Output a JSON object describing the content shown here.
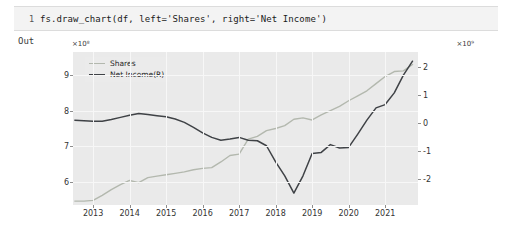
{
  "notebook": {
    "cell_number": "1",
    "code": "fs.draw_chart(df, left='Shares', right='Net Income')",
    "out_label": "Out"
  },
  "chart_data": {
    "type": "line",
    "title": "",
    "xlabel": "",
    "ylabel": "",
    "grid": true,
    "legend_position": "upper-left",
    "left_axis": {
      "label": "Shares",
      "offset_text": "×10⁸",
      "ticks": [
        "9",
        "8",
        "7",
        "6"
      ],
      "tick_values": [
        9,
        8,
        7,
        6
      ],
      "ylim": [
        5.35,
        9.65
      ]
    },
    "right_axis": {
      "label": "Net Income(R)",
      "offset_text": "×10⁹",
      "ticks": [
        "2",
        "1",
        "0",
        "-1",
        "-2"
      ],
      "tick_values": [
        2,
        1,
        0,
        -1,
        -2
      ],
      "ylim": [
        -2.95,
        2.55
      ]
    },
    "x": {
      "ticks": [
        "2013",
        "2014",
        "2015",
        "2016",
        "2017",
        "2018",
        "2019",
        "2020",
        "2021"
      ],
      "tick_values": [
        2013,
        2014,
        2015,
        2016,
        2017,
        2018,
        2019,
        2020,
        2021
      ],
      "xlim": [
        2012.45,
        2021.9
      ]
    },
    "colors": {
      "shares": "#b3b8ae",
      "net_income": "#3f4246",
      "plot_background": "#eaeaea",
      "grid": "#f7f7f7"
    },
    "series": [
      {
        "name": "Shares",
        "axis": "left",
        "color": "#b3b8ae",
        "unit": "1e8",
        "points": [
          [
            2012.5,
            5.46
          ],
          [
            2012.75,
            5.46
          ],
          [
            2013.0,
            5.48
          ],
          [
            2013.25,
            5.62
          ],
          [
            2013.5,
            5.78
          ],
          [
            2013.75,
            5.92
          ],
          [
            2014.0,
            6.04
          ],
          [
            2014.25,
            5.98
          ],
          [
            2014.5,
            6.12
          ],
          [
            2014.75,
            6.16
          ],
          [
            2015.0,
            6.2
          ],
          [
            2015.25,
            6.24
          ],
          [
            2015.5,
            6.28
          ],
          [
            2015.75,
            6.34
          ],
          [
            2016.0,
            6.38
          ],
          [
            2016.25,
            6.4
          ],
          [
            2016.5,
            6.56
          ],
          [
            2016.75,
            6.74
          ],
          [
            2017.0,
            6.78
          ],
          [
            2017.25,
            7.2
          ],
          [
            2017.5,
            7.28
          ],
          [
            2017.75,
            7.44
          ],
          [
            2018.0,
            7.5
          ],
          [
            2018.25,
            7.58
          ],
          [
            2018.5,
            7.76
          ],
          [
            2018.75,
            7.8
          ],
          [
            2019.0,
            7.74
          ],
          [
            2019.25,
            7.88
          ],
          [
            2019.5,
            8.0
          ],
          [
            2019.75,
            8.12
          ],
          [
            2020.0,
            8.28
          ],
          [
            2020.25,
            8.42
          ],
          [
            2020.5,
            8.56
          ],
          [
            2020.75,
            8.76
          ],
          [
            2021.0,
            8.96
          ],
          [
            2021.25,
            9.1
          ],
          [
            2021.5,
            9.12
          ],
          [
            2021.75,
            9.3
          ]
        ]
      },
      {
        "name": "Net Income(R)",
        "axis": "right",
        "color": "#3f4246",
        "unit": "1e9",
        "points": [
          [
            2012.5,
            0.1
          ],
          [
            2012.75,
            0.08
          ],
          [
            2013.0,
            0.06
          ],
          [
            2013.25,
            0.06
          ],
          [
            2013.5,
            0.12
          ],
          [
            2013.75,
            0.2
          ],
          [
            2014.0,
            0.28
          ],
          [
            2014.25,
            0.34
          ],
          [
            2014.5,
            0.3
          ],
          [
            2014.75,
            0.26
          ],
          [
            2015.0,
            0.22
          ],
          [
            2015.25,
            0.14
          ],
          [
            2015.5,
            0.02
          ],
          [
            2015.75,
            -0.16
          ],
          [
            2016.0,
            -0.36
          ],
          [
            2016.25,
            -0.52
          ],
          [
            2016.5,
            -0.62
          ],
          [
            2016.75,
            -0.58
          ],
          [
            2017.0,
            -0.52
          ],
          [
            2017.25,
            -0.62
          ],
          [
            2017.5,
            -0.64
          ],
          [
            2017.75,
            -0.82
          ],
          [
            2018.0,
            -1.4
          ],
          [
            2018.25,
            -1.9
          ],
          [
            2018.5,
            -2.52
          ],
          [
            2018.75,
            -1.9
          ],
          [
            2019.0,
            -1.1
          ],
          [
            2019.25,
            -1.06
          ],
          [
            2019.5,
            -0.78
          ],
          [
            2019.75,
            -0.9
          ],
          [
            2020.0,
            -0.88
          ],
          [
            2020.25,
            -0.4
          ],
          [
            2020.5,
            0.1
          ],
          [
            2020.75,
            0.54
          ],
          [
            2021.0,
            0.66
          ],
          [
            2021.25,
            1.08
          ],
          [
            2021.5,
            1.72
          ],
          [
            2021.75,
            2.22
          ]
        ]
      }
    ]
  }
}
